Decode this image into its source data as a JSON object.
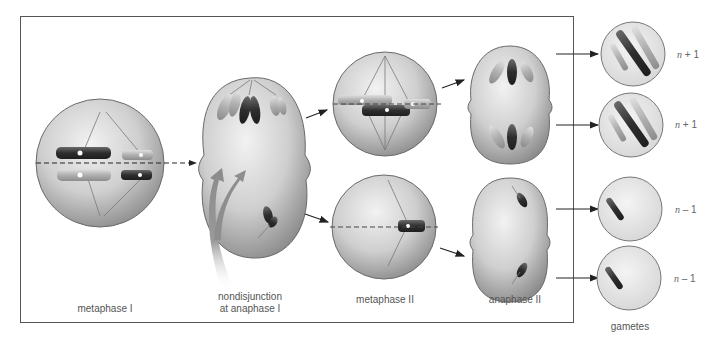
{
  "diagram": {
    "title": "Nondisjunction at anaphase I",
    "stages": [
      {
        "id": "metaphase-1",
        "label": "metaphase I"
      },
      {
        "id": "anaphase-1",
        "label_line1": "nondisjunction",
        "label_line2": "at anaphase I"
      },
      {
        "id": "metaphase-2",
        "label": "metaphase II"
      },
      {
        "id": "anaphase-2",
        "label": "anaphase II"
      }
    ],
    "gametes": {
      "label": "gametes",
      "items": [
        {
          "ploidy_var": "n",
          "ploidy_op": "+ 1"
        },
        {
          "ploidy_var": "n",
          "ploidy_op": "+ 1"
        },
        {
          "ploidy_var": "n",
          "ploidy_op": "– 1"
        },
        {
          "ploidy_var": "n",
          "ploidy_op": "– 1"
        }
      ]
    },
    "colors": {
      "cell_fill": "#c8c8c8",
      "cell_edge": "#6a6a6a",
      "chromosome_dark": "#3a3a3a",
      "chromosome_light": "#b5b5b5",
      "spindle": "#7a7a7a",
      "arrow": "#222222",
      "frame": "#555555"
    }
  }
}
